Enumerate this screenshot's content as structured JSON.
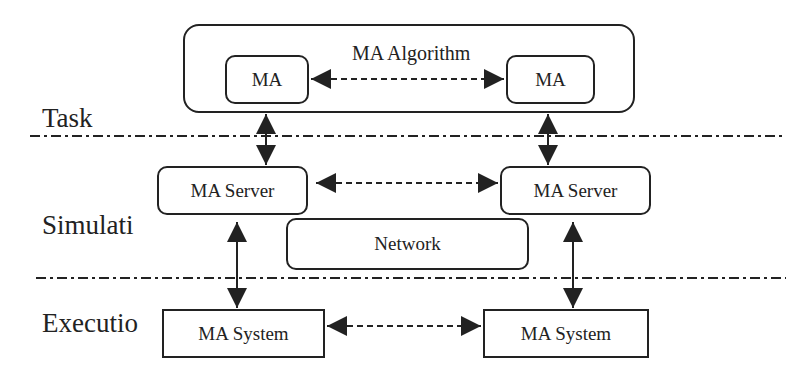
{
  "diagram": {
    "layers": [
      {
        "label": "Task"
      },
      {
        "label": "Simulati"
      },
      {
        "label": "Executio"
      }
    ],
    "task": {
      "container_label": "MA Algorithm",
      "left_node": "MA",
      "right_node": "MA"
    },
    "simulation": {
      "left_server": "MA Server",
      "right_server": "MA Server",
      "network": "Network"
    },
    "execution": {
      "left_system": "MA System",
      "right_system": "MA System"
    },
    "colors": {
      "stroke": "#222222",
      "background": "#ffffff"
    }
  }
}
